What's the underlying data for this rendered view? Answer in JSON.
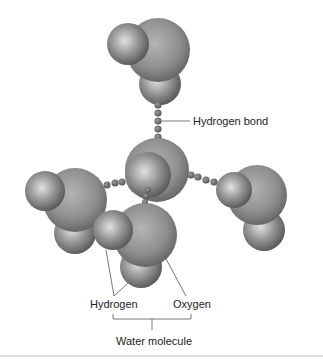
{
  "diagram": {
    "labels": {
      "hydrogen_bond": "Hydrogen bond",
      "hydrogen": "Hydrogen",
      "oxygen": "Oxygen",
      "water_molecule": "Water molecule"
    },
    "molecules": [
      {
        "id": "top",
        "role": "water molecule"
      },
      {
        "id": "center",
        "role": "water molecule"
      },
      {
        "id": "left",
        "role": "water molecule"
      },
      {
        "id": "right",
        "role": "water molecule"
      },
      {
        "id": "bottom",
        "role": "water molecule (labeled)"
      }
    ],
    "colors": {
      "oxygen_fill": "#8e8e8e",
      "hydrogen_fill": "#9a9a9a",
      "bond_dots": "#6e6e6e",
      "leader_lines": "#555555",
      "text": "#222222"
    }
  }
}
